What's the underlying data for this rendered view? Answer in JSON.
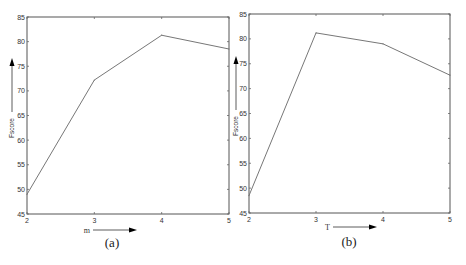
{
  "chart_data": [
    {
      "type": "line",
      "caption": "(a)",
      "title": "",
      "xlabel": "m",
      "ylabel": "Fscore",
      "x": [
        2,
        3,
        4,
        5
      ],
      "series": [
        {
          "name": "Fscore",
          "values": [
            49,
            72.2,
            81.3,
            78.5
          ]
        }
      ],
      "xlim": [
        2,
        5
      ],
      "ylim": [
        45,
        85
      ],
      "xticks": [
        2,
        3,
        4,
        5
      ],
      "yticks": [
        45,
        50,
        55,
        60,
        65,
        70,
        75,
        80,
        85
      ],
      "grid": false,
      "legend": "none"
    },
    {
      "type": "line",
      "caption": "(b)",
      "title": "",
      "xlabel": "T",
      "ylabel": "Fscore",
      "x": [
        2,
        3,
        4,
        5
      ],
      "series": [
        {
          "name": "Fscore",
          "values": [
            48.5,
            81.2,
            79,
            72.7
          ]
        }
      ],
      "xlim": [
        2,
        5
      ],
      "ylim": [
        45,
        85
      ],
      "xticks": [
        2,
        3,
        4,
        5
      ],
      "yticks": [
        45,
        50,
        55,
        60,
        65,
        70,
        75,
        80,
        85
      ],
      "grid": false,
      "legend": "none"
    }
  ]
}
